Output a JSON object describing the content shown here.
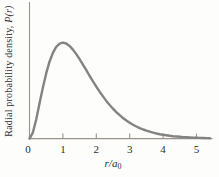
{
  "figure": {
    "ylabel_text": "Radial probability density, ",
    "ylabel_math": "P(r)",
    "xlabel_main": "r/a",
    "xlabel_sub": "0"
  },
  "colors": {
    "curve": "#838383",
    "axis": "#9a948c",
    "text": "#2f2f2f",
    "background": "#fdfdfb"
  },
  "chart_data": {
    "type": "line",
    "title": "",
    "xlabel": "r/a0",
    "ylabel": "Radial probability density, P(r)",
    "x_ticks": [
      0,
      1,
      2,
      3,
      4,
      5
    ],
    "x_tick_labels": [
      "0",
      "1",
      "2",
      "3",
      "4",
      "5"
    ],
    "xlim": [
      0,
      5.45
    ],
    "ylim": [
      0,
      1.4
    ],
    "y_ticks": [],
    "grid": false,
    "legend": false,
    "curve_description": "Hydrogen 1s radial probability density P(r) proportional to r^2 e^(-2r/a0), normalized to peak value 1 at r/a0 = 1",
    "peak": {
      "x": 1,
      "y": 1
    },
    "series": [
      {
        "name": "P(r)",
        "x": [
          0,
          0.1,
          0.2,
          0.3,
          0.4,
          0.5,
          0.6,
          0.7,
          0.8,
          0.9,
          1,
          1.1,
          1.2,
          1.3,
          1.4,
          1.5,
          1.6,
          1.7,
          1.8,
          1.9,
          2,
          2.1,
          2.2,
          2.3,
          2.4,
          2.5,
          2.6,
          2.7,
          2.8,
          2.9,
          3,
          3.1,
          3.2,
          3.3,
          3.4,
          3.5,
          3.6,
          3.7,
          3.8,
          3.9,
          4,
          4.1,
          4.2,
          4.3,
          4.4,
          4.5,
          4.6,
          4.7,
          4.8,
          4.9,
          5,
          5.1,
          5.2,
          5.3,
          5.4
        ],
        "y": [
          0,
          0.0605,
          0.1981,
          0.365,
          0.5312,
          0.6796,
          0.8012,
          0.8929,
          0.9547,
          0.9893,
          1,
          0.9907,
          0.9653,
          0.9275,
          0.8807,
          0.8277,
          0.7711,
          0.7127,
          0.6541,
          0.5967,
          0.5413,
          0.4886,
          0.4391,
          0.3929,
          0.3503,
          0.3112,
          0.2756,
          0.2433,
          0.2142,
          0.1881,
          0.1648,
          0.1441,
          0.1257,
          0.1095,
          0.0951,
          0.0825,
          0.0715,
          0.0618,
          0.0534,
          0.046,
          0.0397,
          0.0341,
          0.0293,
          0.0252,
          0.0216,
          0.0185,
          0.0158,
          0.0135,
          0.0115,
          0.0098,
          0.0084,
          0.0071,
          0.0061,
          0.0052,
          0.0044
        ]
      }
    ]
  }
}
